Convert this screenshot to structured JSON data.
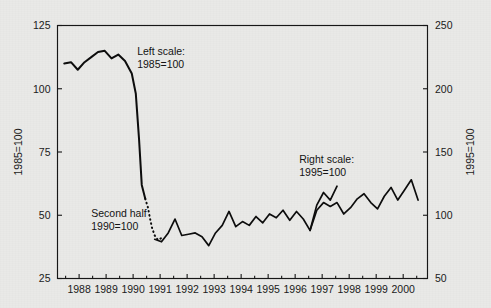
{
  "chart_data": {
    "type": "line",
    "title": "",
    "subtitle": "",
    "xlabel": "",
    "ylabel": "1985=100",
    "ylabel_right": "1995=100",
    "grid": false,
    "legend_position": "inline-annotations",
    "xlim": [
      1987.2,
      2000.9
    ],
    "ylim": [
      25,
      125
    ],
    "ylim_right": [
      50,
      250
    ],
    "x_tick_labels": [
      "1988",
      "1989",
      "1990",
      "1991",
      "1992",
      "1993",
      "1994",
      "1995",
      "1996",
      "1997",
      "1998",
      "1999",
      "2000"
    ],
    "x_ticks": [
      1988,
      1989,
      1990,
      1991,
      1992,
      1993,
      1994,
      1995,
      1996,
      1997,
      1998,
      1999,
      2000
    ],
    "y_ticks": [
      25,
      50,
      75,
      100,
      125
    ],
    "y_tick_labels": [
      "25",
      "50",
      "75",
      "100",
      "125"
    ],
    "y_ticks_right": [
      50,
      100,
      150,
      200,
      250
    ],
    "y_tick_labels_right": [
      "50",
      "100",
      "150",
      "200",
      "250"
    ],
    "annotations": [
      {
        "name": "left-scale-annotation",
        "line1": "Left scale:",
        "line2": "1985=100",
        "x": 1990.15,
        "y": 113.5
      },
      {
        "name": "second-half-annotation",
        "line1": "Second half",
        "line2": "1990=100",
        "x": 1988.45,
        "y": 49.5
      },
      {
        "name": "right-scale-annotation",
        "line1": "Right scale:",
        "line2": "1995=100",
        "x": 1996.15,
        "y": 70.5
      }
    ],
    "series": [
      {
        "name": "left-scale-series",
        "label": "Left scale: 1985=100",
        "scale": "left",
        "style": "solid",
        "x": [
          1987.45,
          1987.7,
          1987.95,
          1988.2,
          1988.45,
          1988.7,
          1988.95,
          1989.2,
          1989.45,
          1989.7,
          1989.95,
          1990.1,
          1990.22,
          1990.32,
          1990.45
        ],
        "values": [
          110.0,
          110.5,
          107.5,
          110.5,
          112.5,
          114.5,
          115.0,
          112.0,
          113.5,
          111.0,
          106.0,
          98.0,
          80.0,
          62.0,
          56.5
        ]
      },
      {
        "name": "splice-series-dotted",
        "label": "Second half 1990=100",
        "scale": "right",
        "style": "dotted",
        "x": [
          1990.45,
          1990.55,
          1990.62,
          1990.7,
          1990.8,
          1990.92,
          1991.05
        ],
        "values": [
          113.0,
          106.0,
          98.0,
          90.0,
          84.0,
          80.5,
          82.0
        ]
      },
      {
        "name": "second-half-series",
        "label": "Second half 1990=100",
        "scale": "right",
        "style": "solid",
        "x": [
          1990.8,
          1991.05,
          1991.3,
          1991.55,
          1991.8,
          1992.05,
          1992.3,
          1992.55,
          1992.8,
          1993.05,
          1993.3,
          1993.55,
          1993.8,
          1994.05,
          1994.3,
          1994.55,
          1994.8,
          1995.05,
          1995.3,
          1995.55,
          1995.8,
          1996.05,
          1996.3,
          1996.55,
          1996.8,
          1997.05,
          1997.3,
          1997.55
        ],
        "values": [
          81.0,
          79.0,
          86.0,
          97.0,
          84.0,
          85.0,
          86.0,
          83.0,
          76.0,
          86.0,
          92.0,
          103.0,
          91.0,
          95.0,
          92.0,
          99.0,
          94.0,
          101.0,
          98.0,
          104.0,
          96.0,
          103.0,
          97.0,
          88.0,
          108.0,
          118.0,
          112.0,
          123.0
        ]
      },
      {
        "name": "right-scale-series",
        "label": "Right scale: 1995=100",
        "scale": "right",
        "style": "solid",
        "x": [
          1996.55,
          1996.8,
          1997.05,
          1997.3,
          1997.55,
          1997.8,
          1998.05,
          1998.3,
          1998.55,
          1998.8,
          1999.05,
          1999.3,
          1999.55,
          1999.8,
          2000.05,
          2000.3,
          2000.55
        ],
        "values": [
          88.0,
          104.0,
          110.0,
          107.0,
          110.0,
          101.0,
          106.0,
          113.0,
          117.0,
          110.0,
          105.0,
          115.0,
          122.0,
          112.0,
          120.0,
          128.0,
          112.0
        ]
      }
    ]
  },
  "figure": {
    "background_color": "#e9e9e7",
    "ink_color": "#0d0d0d"
  }
}
